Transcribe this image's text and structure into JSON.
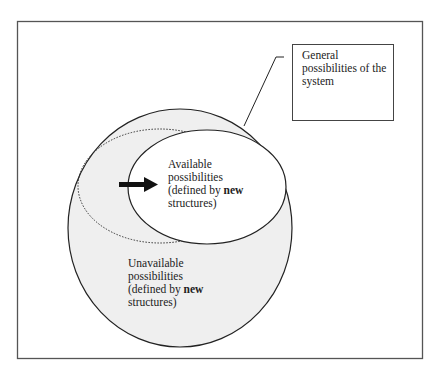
{
  "diagram": {
    "callout": {
      "line1": "General",
      "line2": "possibilities of the",
      "line3": "system"
    },
    "available": {
      "line1": "Available",
      "line2": "possibilities",
      "line3_prefix": "(defined by ",
      "line3_bold": "new",
      "line4": "structures)"
    },
    "unavailable": {
      "line1": "Unavailable",
      "line2": "possibilities",
      "line3_prefix": "(defined by ",
      "line3_bold": "new",
      "line4": "structures)"
    },
    "colors": {
      "shaded_region": "#efefef",
      "line": "#222222",
      "frame": "#555555"
    }
  }
}
